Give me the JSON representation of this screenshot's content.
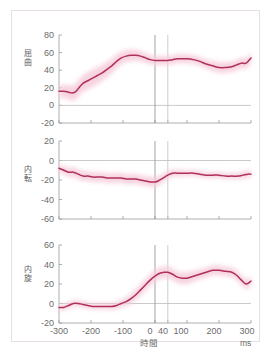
{
  "figure": {
    "frame_color": "#e9dfe2",
    "line_color": "#b03058",
    "band_color": "#f6ccda",
    "axis_color": "#9a9a9a",
    "tick_text_color": "#6b6b6b",
    "marker_0_color": "#8a8a8a",
    "marker_40_color": "#c0c0c0",
    "x_axis_label": "時間",
    "x_unit_label": "ms",
    "x_ticks": [
      "-300",
      "-200",
      "-100",
      "0",
      "40",
      "100",
      "200",
      "300"
    ],
    "x_tick_values": [
      -300,
      -200,
      -100,
      0,
      40,
      100,
      200,
      300
    ],
    "event_markers": [
      0,
      40
    ]
  },
  "chart_data": [
    {
      "type": "line",
      "title": "",
      "ylabel": "屈曲",
      "ylabel_chars": [
        "屈",
        "曲"
      ],
      "xlabel": "時間",
      "xunit": "ms",
      "xlim": [
        -300,
        300
      ],
      "ylim": [
        -20,
        80
      ],
      "yticks": [
        80,
        60,
        40,
        20,
        0,
        -20
      ],
      "ytick_labels": [
        "80",
        "60",
        "40",
        "20",
        "0",
        "-20"
      ],
      "grid": false,
      "zero_line": true,
      "series": [
        {
          "name": "mean",
          "x": [
            -300,
            -285,
            -270,
            -260,
            -250,
            -240,
            -225,
            -210,
            -195,
            -180,
            -165,
            -150,
            -135,
            -120,
            -105,
            -90,
            -75,
            -60,
            -45,
            -30,
            -15,
            0,
            15,
            30,
            40,
            55,
            70,
            85,
            100,
            120,
            140,
            160,
            180,
            200,
            220,
            240,
            255,
            270,
            285,
            300
          ],
          "values": [
            16,
            16,
            15,
            14,
            15,
            19,
            25,
            28,
            31,
            34,
            37,
            41,
            45,
            50,
            54,
            56,
            57,
            57,
            56,
            54,
            52,
            51,
            51,
            51,
            51,
            52,
            53,
            53,
            53,
            52,
            50,
            47,
            45,
            43,
            43,
            44,
            46,
            48,
            48,
            54
          ]
        },
        {
          "name": "sd_band_half_width",
          "x": [
            -300,
            -250,
            -200,
            -150,
            -100,
            -50,
            0,
            40,
            100,
            150,
            200,
            250,
            300
          ],
          "values": [
            7,
            9,
            10,
            9,
            7,
            6,
            5,
            5,
            5,
            5,
            6,
            6,
            6
          ]
        }
      ]
    },
    {
      "type": "line",
      "title": "",
      "ylabel": "内転",
      "ylabel_chars": [
        "内",
        "転"
      ],
      "xlabel": "時間",
      "xunit": "ms",
      "xlim": [
        -300,
        300
      ],
      "ylim": [
        -60,
        20
      ],
      "yticks": [
        20,
        0,
        -20,
        -40,
        -60
      ],
      "ytick_labels": [
        "20",
        "0",
        "-20",
        "-40",
        "-60"
      ],
      "grid": false,
      "zero_line": true,
      "series": [
        {
          "name": "mean",
          "x": [
            -300,
            -285,
            -270,
            -255,
            -240,
            -225,
            -210,
            -195,
            -180,
            -165,
            -150,
            -135,
            -120,
            -105,
            -90,
            -75,
            -60,
            -45,
            -30,
            -15,
            0,
            10,
            20,
            30,
            40,
            55,
            70,
            85,
            100,
            120,
            140,
            160,
            180,
            200,
            220,
            240,
            260,
            275,
            290,
            300
          ],
          "values": [
            -8,
            -10,
            -12,
            -12,
            -14,
            -16,
            -16,
            -17,
            -17,
            -17,
            -18,
            -18,
            -18,
            -18,
            -19,
            -19,
            -19,
            -20,
            -21,
            -22,
            -22,
            -21,
            -19,
            -17,
            -15,
            -13,
            -13,
            -13,
            -13,
            -13,
            -14,
            -15,
            -15,
            -15,
            -16,
            -16,
            -16,
            -15,
            -14,
            -14
          ]
        },
        {
          "name": "sd_band_half_width",
          "x": [
            -300,
            -250,
            -200,
            -150,
            -100,
            -50,
            0,
            40,
            100,
            150,
            200,
            250,
            300
          ],
          "values": [
            4,
            5,
            5,
            5,
            5,
            5,
            5,
            4,
            3,
            3,
            3,
            3,
            4
          ]
        }
      ]
    },
    {
      "type": "line",
      "title": "",
      "ylabel": "内旋",
      "ylabel_chars": [
        "内",
        "旋"
      ],
      "xlabel": "時間",
      "xunit": "ms",
      "xlim": [
        -300,
        300
      ],
      "ylim": [
        -20,
        60
      ],
      "yticks": [
        60,
        40,
        20,
        0,
        -20
      ],
      "ytick_labels": [
        "60",
        "40",
        "20",
        "0",
        "-20"
      ],
      "grid": false,
      "zero_line": true,
      "series": [
        {
          "name": "mean",
          "x": [
            -300,
            -285,
            -270,
            -255,
            -240,
            -225,
            -210,
            -195,
            -180,
            -165,
            -150,
            -135,
            -120,
            -105,
            -90,
            -75,
            -60,
            -45,
            -30,
            -15,
            0,
            15,
            30,
            40,
            55,
            70,
            85,
            100,
            120,
            140,
            160,
            180,
            200,
            220,
            240,
            255,
            270,
            285,
            300
          ],
          "values": [
            -4,
            -4,
            -2,
            0,
            0,
            -1,
            -2,
            -3,
            -3,
            -3,
            -3,
            -3,
            -2,
            0,
            2,
            5,
            9,
            14,
            19,
            24,
            28,
            31,
            32,
            32,
            30,
            27,
            26,
            26,
            28,
            30,
            32,
            34,
            34,
            33,
            32,
            29,
            24,
            20,
            23
          ]
        },
        {
          "name": "sd_band_half_width",
          "x": [
            -300,
            -250,
            -200,
            -150,
            -100,
            -50,
            0,
            40,
            100,
            150,
            200,
            250,
            300
          ],
          "values": [
            3,
            3,
            3,
            3,
            4,
            6,
            6,
            6,
            6,
            5,
            5,
            5,
            5
          ]
        }
      ]
    }
  ]
}
